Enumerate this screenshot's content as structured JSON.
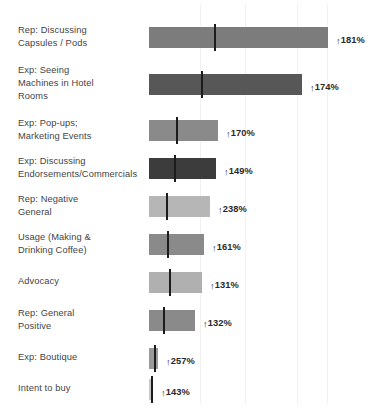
{
  "chart_data": {
    "type": "bar",
    "title": "",
    "subtitle": "",
    "xlabel": "",
    "ylabel": "",
    "grid": true,
    "grid_axis": "x",
    "legend": "none",
    "orientation": "horizontal",
    "value_suffix": "%",
    "value_prefix_icon": "up-arrow",
    "xlim": [
      0,
      280
    ],
    "categories": [
      "Rep: Discussing\nCapsules / Pods",
      "Exp: Seeing\nMachines in Hotel\nRooms",
      "Exp: Pop-ups;\nMarketing Events",
      "Exp: Discussing\nEndorsements/Commercials",
      "Rep: Negative\nGeneral",
      "Usage (Making &\nDrinking Coffee)",
      "Advocacy",
      "Rep: General\nPositive",
      "Exp: Boutique",
      "Intent to buy"
    ],
    "values": [
      181,
      174,
      170,
      149,
      238,
      161,
      131,
      132,
      257,
      143
    ],
    "value_labels": [
      "181%",
      "174%",
      "170%",
      "149%",
      "238%",
      "161%",
      "131%",
      "132%",
      "257%",
      "143%"
    ],
    "bar_lengths_px": [
      179,
      153,
      69,
      67,
      61,
      55,
      53,
      46,
      9,
      4
    ],
    "marker_offsets_px": [
      65,
      52,
      27,
      25,
      17,
      18,
      20,
      14,
      5,
      3
    ],
    "bar_colors": [
      "#7c7c7c",
      "#575757",
      "#8a8a8a",
      "#3c3c3c",
      "#b6b6b6",
      "#8a8a8a",
      "#b0b0b0",
      "#8a8a8a",
      "#9a9a9a",
      "#c9c9c9"
    ],
    "marker_color": "#1c1c1c",
    "gridline_color": "#f1f1f1",
    "gridlines_px": [
      200,
      245,
      297,
      327
    ],
    "plot_left_px": 149
  },
  "rows": [
    {
      "label": "Rep: Discussing\nCapsules / Pods",
      "value_label": "181%",
      "arrow": "↑",
      "label_top": 24,
      "bar_top": 27,
      "bar_height": 21,
      "bar_left": 149,
      "bar_width": 179,
      "marker_left": 65,
      "color": "#7c7c7c",
      "value_left": 336,
      "value_top": 34
    },
    {
      "label": "Exp: Seeing\nMachines in Hotel\nRooms",
      "value_label": "174%",
      "arrow": "↑",
      "label_top": 64,
      "bar_top": 74,
      "bar_height": 21,
      "bar_left": 149,
      "bar_width": 153,
      "marker_left": 52,
      "color": "#575757",
      "value_left": 310,
      "value_top": 81
    },
    {
      "label": "Exp: Pop-ups;\nMarketing Events",
      "value_label": "170%",
      "arrow": "↑",
      "label_top": 117,
      "bar_top": 120,
      "bar_height": 21,
      "bar_left": 149,
      "bar_width": 69,
      "marker_left": 27,
      "color": "#8a8a8a",
      "value_left": 226,
      "value_top": 127
    },
    {
      "label": "Exp: Discussing\nEndorsements/Commercials",
      "value_label": "149%",
      "arrow": "↑",
      "label_top": 155,
      "bar_top": 158,
      "bar_height": 21,
      "bar_left": 149,
      "bar_width": 67,
      "marker_left": 25,
      "color": "#3c3c3c",
      "value_left": 224,
      "value_top": 165
    },
    {
      "label": "Rep: Negative\nGeneral",
      "value_label": "238%",
      "arrow": "↑",
      "label_top": 193,
      "bar_top": 196,
      "bar_height": 21,
      "bar_left": 149,
      "bar_width": 61,
      "marker_left": 17,
      "color": "#b6b6b6",
      "value_left": 218,
      "value_top": 203
    },
    {
      "label": "Usage (Making &\nDrinking Coffee)",
      "value_label": "161%",
      "arrow": "↑",
      "label_top": 231,
      "bar_top": 234,
      "bar_height": 21,
      "bar_left": 149,
      "bar_width": 55,
      "marker_left": 18,
      "color": "#8a8a8a",
      "value_left": 212,
      "value_top": 241
    },
    {
      "label": "Advocacy",
      "value_label": "131%",
      "arrow": "↑",
      "label_top": 275,
      "bar_top": 272,
      "bar_height": 21,
      "bar_left": 149,
      "bar_width": 53,
      "marker_left": 20,
      "color": "#b0b0b0",
      "value_left": 210,
      "value_top": 279
    },
    {
      "label": "Rep: General\nPositive",
      "value_label": "132%",
      "arrow": "↑",
      "label_top": 307,
      "bar_top": 310,
      "bar_height": 21,
      "bar_left": 149,
      "bar_width": 46,
      "marker_left": 14,
      "color": "#8a8a8a",
      "value_left": 203,
      "value_top": 317
    },
    {
      "label": "Exp: Boutique",
      "value_label": "257%",
      "arrow": "↑",
      "label_top": 351,
      "bar_top": 348,
      "bar_height": 21,
      "bar_left": 149,
      "bar_width": 9,
      "marker_left": 5,
      "color": "#9a9a9a",
      "value_left": 166,
      "value_top": 355
    },
    {
      "label": "Intent to buy",
      "value_label": "143%",
      "arrow": "↑",
      "label_top": 382,
      "bar_top": 379,
      "bar_height": 21,
      "bar_left": 149,
      "bar_width": 4,
      "marker_left": 2,
      "color": "#c9c9c9",
      "value_left": 161,
      "value_top": 386
    }
  ],
  "gridlines": [
    200,
    245,
    297,
    327
  ]
}
